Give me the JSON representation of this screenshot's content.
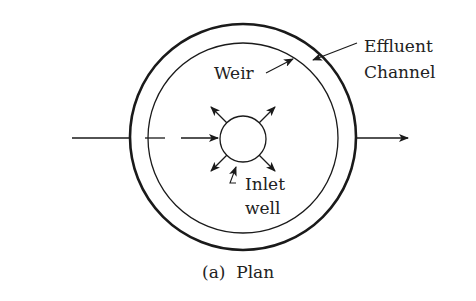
{
  "diagram": {
    "caption": "(a)  Plan",
    "labels": {
      "effluent_line1": "Effluent",
      "effluent_line2": "Channel",
      "weir": "Weir",
      "inlet_line1": "Inlet",
      "inlet_line2": "well"
    },
    "components": [
      {
        "name": "outer-tank-wall",
        "shape": "circle",
        "center": [
          243,
          137
        ],
        "radius": 113
      },
      {
        "name": "weir",
        "shape": "circle",
        "center": [
          243,
          138
        ],
        "radius": 95
      },
      {
        "name": "inlet-well",
        "shape": "circle",
        "center": [
          243,
          139
        ],
        "radius": 23
      }
    ],
    "flows": [
      {
        "name": "influent-pipe",
        "direction": "right",
        "into": "inlet-well"
      },
      {
        "name": "radial-outflow",
        "count": 4,
        "from": "inlet-well"
      },
      {
        "name": "effluent-pipe",
        "direction": "right",
        "from": "outer-tank-wall"
      }
    ],
    "colors": {
      "line": "#1a1a1a",
      "text": "#222222",
      "background": "#ffffff"
    }
  }
}
